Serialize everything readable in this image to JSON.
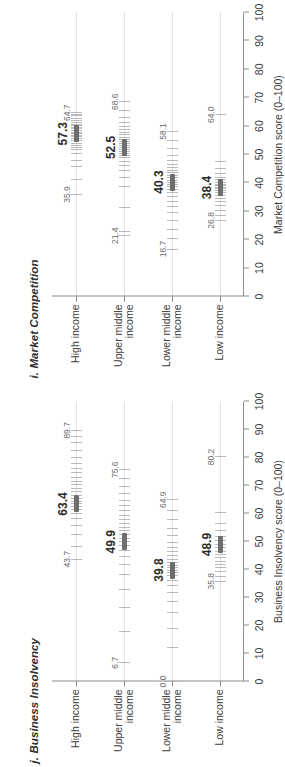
{
  "figure": {
    "background": "#ffffff",
    "mean_marker_color": "#6e6e6e",
    "observation_color": "#b9b9b9",
    "axis_color": "#8c8c8c",
    "rowline_color": "#e2e2e2"
  },
  "panels": [
    {
      "key": "i",
      "title": "i. Market Competition",
      "axis_title": "Market Competition score (0–100)"
    },
    {
      "key": "j",
      "title": "j. Business Insolvency",
      "axis_title": "Business Insolvency score (0–100)"
    }
  ],
  "axis": {
    "ticks": [
      0,
      10,
      20,
      30,
      40,
      50,
      60,
      70,
      80,
      90,
      100
    ],
    "tick_labels": [
      "0",
      "10",
      "20",
      "30",
      "40",
      "50",
      "60",
      "70",
      "80",
      "90",
      "100"
    ],
    "min": 0,
    "max": 100
  },
  "categories": [
    {
      "id": "high",
      "lines": [
        "High income"
      ]
    },
    {
      "id": "upper-middle",
      "lines": [
        "Upper middle",
        "income"
      ]
    },
    {
      "id": "lower-middle",
      "lines": [
        "Lower middle",
        "income"
      ]
    },
    {
      "id": "low",
      "lines": [
        "Low income"
      ]
    }
  ],
  "chart_data": {
    "type": "scatter",
    "xlabel": "Score (0–100)",
    "ylabel": "",
    "xlim": [
      0,
      100
    ],
    "grid": false,
    "legend": "none",
    "categories": [
      "High income",
      "Upper middle income",
      "Lower middle income",
      "Low income"
    ],
    "panels": [
      {
        "key": "i",
        "title": "i. Market Competition",
        "xlabel": "Market Competition score (0–100)",
        "xlim": [
          0,
          100
        ],
        "rows": [
          {
            "category": "High income",
            "mean": 57.3,
            "mean_label": "57.3",
            "min": 35.9,
            "min_label": "35.9",
            "max": 64.7,
            "max_label": "64.7",
            "points": [
              35.9,
              41.2,
              45.8,
              48.0,
              50.3,
              51.6,
              52.4,
              53.1,
              54.0,
              54.8,
              55.5,
              56.2,
              56.8,
              57.3,
              57.9,
              58.4,
              59.0,
              59.6,
              60.1,
              60.7,
              61.3,
              62.0,
              62.8,
              63.6,
              64.1,
              64.7
            ]
          },
          {
            "category": "Upper middle income",
            "mean": 52.5,
            "mean_label": "52.5",
            "min": 21.4,
            "min_label": "21.4",
            "max": 68.6,
            "max_label": "68.6",
            "points": [
              21.4,
              22.8,
              31.5,
              38.6,
              42.0,
              44.5,
              46.2,
              47.6,
              48.8,
              49.7,
              50.5,
              51.2,
              51.9,
              52.5,
              53.1,
              53.8,
              54.5,
              55.2,
              56.0,
              56.9,
              57.8,
              58.7,
              59.8,
              61.2,
              63.0,
              65.4,
              68.6
            ]
          },
          {
            "category": "Lower middle income",
            "mean": 40.3,
            "mean_label": "40.3",
            "min": 16.7,
            "min_label": "16.7",
            "max": 58.1,
            "max_label": "58.1",
            "points": [
              16.7,
              20.4,
              23.6,
              26.9,
              29.5,
              31.8,
              33.6,
              35.2,
              36.6,
              37.8,
              38.9,
              39.6,
              40.3,
              41.0,
              41.8,
              42.6,
              43.5,
              44.4,
              45.4,
              46.6,
              48.0,
              49.8,
              52.0,
              54.8,
              58.1
            ]
          },
          {
            "category": "Low income",
            "mean": 38.4,
            "mean_label": "38.4",
            "min": 26.8,
            "min_label": "26.8",
            "max": 64.0,
            "max_label": "64.0",
            "points": [
              26.8,
              28.6,
              30.4,
              32.0,
              33.4,
              34.6,
              35.6,
              36.5,
              37.2,
              37.9,
              38.4,
              39.0,
              39.6,
              40.3,
              41.1,
              42.0,
              43.2,
              45.0,
              47.6,
              64.0
            ]
          }
        ]
      },
      {
        "key": "j",
        "title": "j. Business Insolvency",
        "xlabel": "Business Insolvency score (0–100)",
        "xlim": [
          0,
          100
        ],
        "rows": [
          {
            "category": "High income",
            "mean": 63.4,
            "mean_label": "63.4",
            "min": 43.7,
            "min_label": "43.7",
            "max": 89.7,
            "max_label": "89.7",
            "points": [
              43.7,
              48.2,
              52.6,
              55.8,
              58.2,
              60.0,
              61.4,
              62.5,
              63.4,
              64.4,
              65.5,
              66.6,
              67.8,
              69.0,
              70.3,
              71.6,
              73.0,
              74.5,
              76.2,
              78.0,
              80.1,
              82.5,
              85.2,
              87.4,
              89.7
            ]
          },
          {
            "category": "Upper middle income",
            "mean": 49.9,
            "mean_label": "49.9",
            "min": 6.7,
            "min_label": "6.7",
            "max": 75.6,
            "max_label": "75.6",
            "points": [
              6.7,
              18.0,
              26.5,
              33.0,
              38.2,
              41.8,
              44.6,
              46.8,
              48.5,
              49.9,
              51.2,
              52.5,
              53.8,
              55.1,
              56.4,
              57.8,
              59.3,
              60.9,
              62.7,
              64.7,
              67.0,
              69.6,
              72.4,
              75.6
            ]
          },
          {
            "category": "Lower middle income",
            "mean": 39.8,
            "mean_label": "39.8",
            "min": 0.0,
            "min_label": "0.0",
            "max": 64.9,
            "max_label": "64.9",
            "points": [
              0.0,
              12.0,
              19.0,
              24.5,
              28.6,
              31.8,
              34.2,
              36.2,
              37.8,
              39.0,
              39.8,
              40.7,
              41.6,
              42.6,
              43.7,
              44.9,
              46.3,
              47.9,
              49.8,
              52.0,
              54.6,
              57.8,
              61.0,
              64.9
            ]
          },
          {
            "category": "Low income",
            "mean": 48.9,
            "mean_label": "48.9",
            "min": 35.8,
            "min_label": "35.8",
            "max": 80.2,
            "max_label": "80.2",
            "points": [
              35.8,
              37.6,
              39.2,
              40.6,
              41.8,
              43.0,
              44.2,
              45.4,
              46.6,
              47.8,
              48.9,
              50.2,
              51.8,
              53.8,
              56.5,
              60.4,
              80.2
            ]
          }
        ]
      }
    ]
  }
}
